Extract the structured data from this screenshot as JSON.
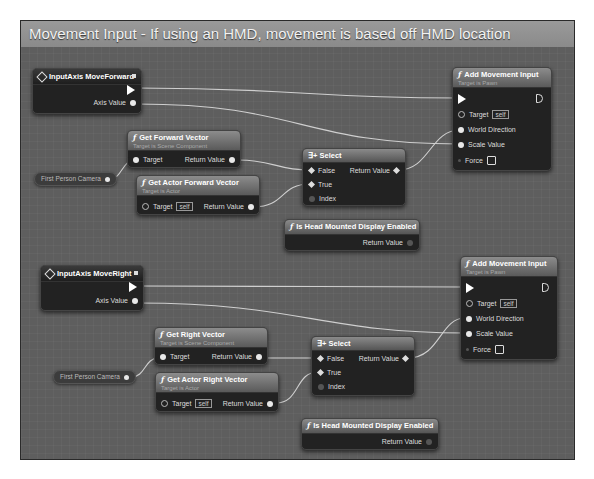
{
  "comment": {
    "title": "Movement Input - If using an HMD, movement is based off HMD location"
  },
  "forward": {
    "event": {
      "title": "InputAxis MoveForward",
      "axis_value": "Axis Value"
    },
    "get_vector": {
      "title": "Get Forward Vector",
      "subtitle": "Target is Scene Component",
      "target": "Target",
      "return": "Return Value"
    },
    "get_actor_vector": {
      "title": "Get Actor Forward Vector",
      "subtitle": "Target is Actor",
      "target": "Target",
      "self": "self",
      "return": "Return Value"
    },
    "camera": {
      "label": "First Person Camera"
    },
    "select": {
      "title": "Select",
      "false": "False",
      "true": "True",
      "index": "Index",
      "return": "Return Value"
    },
    "hmd": {
      "title": "Is Head Mounted Display Enabled",
      "return": "Return Value"
    },
    "add_movement": {
      "title": "Add Movement Input",
      "subtitle": "Target is Pawn",
      "target": "Target",
      "self": "self",
      "world_direction": "World Direction",
      "scale_value": "Scale Value",
      "force": "Force"
    }
  },
  "right": {
    "event": {
      "title": "InputAxis MoveRight",
      "axis_value": "Axis Value"
    },
    "get_vector": {
      "title": "Get Right Vector",
      "subtitle": "Target is Scene Component",
      "target": "Target",
      "return": "Return Value"
    },
    "get_actor_vector": {
      "title": "Get Actor Right Vector",
      "subtitle": "Target is Actor",
      "target": "Target",
      "self": "self",
      "return": "Return Value"
    },
    "camera": {
      "label": "First Person Camera"
    },
    "select": {
      "title": "Select",
      "false": "False",
      "true": "True",
      "index": "Index",
      "return": "Return Value"
    },
    "hmd": {
      "title": "Is Head Mounted Display Enabled",
      "return": "Return Value"
    },
    "add_movement": {
      "title": "Add Movement Input",
      "subtitle": "Target is Pawn",
      "target": "Target",
      "self": "self",
      "world_direction": "World Direction",
      "scale_value": "Scale Value",
      "force": "Force"
    }
  },
  "icons": {
    "function": "ƒ",
    "select": "∃+"
  }
}
